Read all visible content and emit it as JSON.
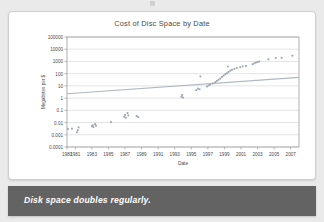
{
  "caption": {
    "text": "Disk space doubles regularly."
  },
  "chart_data": {
    "type": "scatter",
    "title": "Cost of Disc Space by Date",
    "xlabel": "Date",
    "ylabel": "Megabytes per $",
    "yscale": "log",
    "ylim": [
      0.0001,
      100000
    ],
    "xlim": [
      1980,
      2008
    ],
    "grid": true,
    "legend": "none",
    "ytick_labels": [
      "100000",
      "10000",
      "1000",
      "100",
      "10",
      "1",
      "0.1",
      "0.01",
      "0.001",
      "0.0001"
    ],
    "ytick_values": [
      100000,
      10000,
      1000,
      100,
      10,
      1,
      0.1,
      0.01,
      0.001,
      0.0001
    ],
    "xtick_labels": [
      "1980",
      "1981",
      "1983",
      "1985",
      "1987",
      "1989",
      "1991",
      "1993",
      "1995",
      "1997",
      "1999",
      "2001",
      "2003",
      "2005",
      "2007"
    ],
    "xtick_values": [
      1980,
      1981,
      1983,
      1985,
      1987,
      1989,
      1991,
      1993,
      1995,
      1997,
      1999,
      2001,
      2003,
      2005,
      2007
    ],
    "colors": {
      "points": "#9aa3b0",
      "trend": "#b0b7c2",
      "grid": "#d8d8d8",
      "axis": "#9b9b9b",
      "text": "#4a4a4a"
    },
    "series": [
      {
        "name": "Disc cost observations",
        "points": [
          [
            1980.1,
            0.003
          ],
          [
            1980.6,
            0.0032
          ],
          [
            1981.2,
            0.0016
          ],
          [
            1981.3,
            0.0024
          ],
          [
            1981.4,
            0.004
          ],
          [
            1983.0,
            0.005
          ],
          [
            1983.1,
            0.006
          ],
          [
            1983.2,
            0.0042
          ],
          [
            1983.4,
            0.0075
          ],
          [
            1983.5,
            0.0055
          ],
          [
            1985.3,
            0.011
          ],
          [
            1986.9,
            0.03
          ],
          [
            1987.0,
            0.042
          ],
          [
            1987.1,
            0.025
          ],
          [
            1987.3,
            0.06
          ],
          [
            1987.4,
            0.038
          ],
          [
            1988.4,
            0.034
          ],
          [
            1988.6,
            0.028
          ],
          [
            1993.8,
            1.3
          ],
          [
            1993.9,
            1.8
          ],
          [
            1994.0,
            1.1
          ],
          [
            1995.6,
            4.5
          ],
          [
            1995.8,
            6.0
          ],
          [
            1996.0,
            5.2
          ],
          [
            1996.1,
            60.0
          ],
          [
            1996.9,
            9.0
          ],
          [
            1997.1,
            11.0
          ],
          [
            1997.3,
            13.0
          ],
          [
            1997.6,
            16.0
          ],
          [
            1997.9,
            20.0
          ],
          [
            1998.1,
            26.0
          ],
          [
            1998.3,
            32.0
          ],
          [
            1998.5,
            40.0
          ],
          [
            1998.7,
            55.0
          ],
          [
            1998.9,
            70.0
          ],
          [
            1999.1,
            90.0
          ],
          [
            1999.3,
            110.0
          ],
          [
            1999.5,
            140.0
          ],
          [
            1999.7,
            175.0
          ],
          [
            1999.9,
            210.0
          ],
          [
            1999.4,
            380.0
          ],
          [
            2000.2,
            250.0
          ],
          [
            2000.5,
            300.0
          ],
          [
            2000.9,
            330.0
          ],
          [
            2001.2,
            400.0
          ],
          [
            2001.6,
            430.0
          ],
          [
            2002.4,
            600.0
          ],
          [
            2002.6,
            700.0
          ],
          [
            2002.8,
            820.0
          ],
          [
            2003.0,
            900.0
          ],
          [
            2003.2,
            1000.0
          ],
          [
            2004.3,
            1500.0
          ],
          [
            2005.2,
            1900.0
          ],
          [
            2005.9,
            2000.0
          ],
          [
            2007.2,
            3000.0
          ]
        ]
      }
    ],
    "trend_line": {
      "name": "shallow reference trend",
      "points": [
        [
          1980,
          2.3
        ],
        [
          2008,
          50
        ]
      ]
    }
  }
}
